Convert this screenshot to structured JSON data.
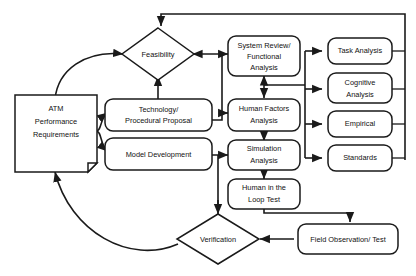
{
  "diagram": {
    "background_color": "#ffffff",
    "line_color": "#1a1a1a",
    "text_color": "#111111",
    "nodes": {
      "atm": {
        "label_line1": "ATM",
        "label_line2": "Performance",
        "label_line3": "Requirements",
        "shape": "document"
      },
      "feasibility": {
        "label": "Feasibility",
        "shape": "diamond"
      },
      "technology": {
        "label_line1": "Technology/",
        "label_line2": "Procedural Proposal",
        "shape": "rounded-rect"
      },
      "model": {
        "label": "Model Development",
        "shape": "rounded-rect"
      },
      "system_review": {
        "label_line1": "System Review/",
        "label_line2": "Functional",
        "label_line3": "Analysis",
        "shape": "rounded-rect"
      },
      "human_factors": {
        "label_line1": "Human Factors",
        "label_line2": "Analysis",
        "shape": "rounded-rect"
      },
      "simulation": {
        "label_line1": "Simulation",
        "label_line2": "Analysis",
        "shape": "rounded-rect"
      },
      "loop_test": {
        "label_line1": "Human in the",
        "label_line2": "Loop Test",
        "shape": "rounded-rect"
      },
      "task_analysis": {
        "label": "Task Analysis",
        "shape": "rounded-rect"
      },
      "cognitive": {
        "label_line1": "Cognitive",
        "label_line2": "Analysis",
        "shape": "rounded-rect"
      },
      "empirical": {
        "label": "Empirical",
        "shape": "rounded-rect"
      },
      "standards": {
        "label": "Standards",
        "shape": "rounded-rect"
      },
      "verification": {
        "label": "Verification",
        "shape": "diamond"
      },
      "field_observation": {
        "label": "Field Observation/ Test",
        "shape": "rounded-rect"
      }
    },
    "edges": [
      {
        "from": "verification",
        "to": "atm",
        "style": "curved",
        "arrow": "single"
      },
      {
        "from": "atm",
        "to": "feasibility",
        "style": "curved",
        "arrow": "single"
      },
      {
        "from": "atm",
        "to": "technology",
        "style": "curved",
        "arrow": "single"
      },
      {
        "from": "atm",
        "to": "model",
        "style": "curved",
        "arrow": "single"
      },
      {
        "from": "technology",
        "to": "feasibility",
        "style": "straight",
        "arrow": "single"
      },
      {
        "from": "feasibility",
        "to": "system_review",
        "style": "straight",
        "arrow": "double"
      },
      {
        "from": "technology",
        "to": "human_factors",
        "style": "straight",
        "arrow": "single"
      },
      {
        "from": "model",
        "to": "simulation",
        "style": "straight",
        "arrow": "single"
      },
      {
        "from": "system_review",
        "to": "human_factors",
        "style": "straight",
        "arrow": "double"
      },
      {
        "from": "human_factors",
        "to": "simulation",
        "style": "straight",
        "arrow": "single"
      },
      {
        "from": "simulation",
        "to": "loop_test",
        "style": "straight",
        "arrow": "single"
      },
      {
        "from": "human_factors_bus",
        "to": "task_analysis",
        "style": "orthogonal",
        "arrow": "single"
      },
      {
        "from": "human_factors_bus",
        "to": "cognitive",
        "style": "orthogonal",
        "arrow": "single"
      },
      {
        "from": "human_factors_bus",
        "to": "empirical",
        "style": "orthogonal",
        "arrow": "single"
      },
      {
        "from": "human_factors_bus",
        "to": "standards",
        "style": "orthogonal",
        "arrow": "single"
      },
      {
        "from": "right_column_bus",
        "to": "feasibility",
        "style": "orthogonal-top",
        "arrow": "single"
      },
      {
        "from": "model",
        "to": "verification",
        "style": "orthogonal",
        "arrow": "single"
      },
      {
        "from": "loop_test",
        "to": "field_observation",
        "style": "orthogonal",
        "arrow": "single"
      },
      {
        "from": "field_observation",
        "to": "verification",
        "style": "straight",
        "arrow": "single"
      }
    ]
  }
}
